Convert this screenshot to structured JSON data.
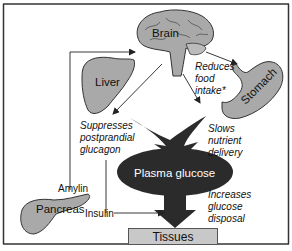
{
  "diagram": {
    "top_cut_text": "…",
    "organs": {
      "brain": "Brain",
      "liver": "Liver",
      "stomach": "Stomach",
      "pancreas": "Pancreas",
      "plasma_glucose": "Plasma glucose",
      "tissues": "Tissues"
    },
    "hormones": {
      "amylin": "Amylin",
      "insulin": "Insulin"
    },
    "effects": {
      "reduces_food_intake": [
        "Reduces",
        "food",
        "intake*"
      ],
      "suppresses_glucagon": [
        "Suppresses",
        "postprandial",
        "glucagon"
      ],
      "slows_nutrient_delivery": [
        "Slows",
        "nutrient",
        "delivery"
      ],
      "increases_glucose_disposal": [
        "Increases",
        "glucose",
        "disposal"
      ]
    },
    "colors": {
      "organ_fill": "#a9a9a9",
      "ellipse_fill": "#2b2b2b",
      "arrow_fill": "#2b2b2b",
      "tissues_fill": "#c8c8c8",
      "line": "#222222"
    }
  }
}
